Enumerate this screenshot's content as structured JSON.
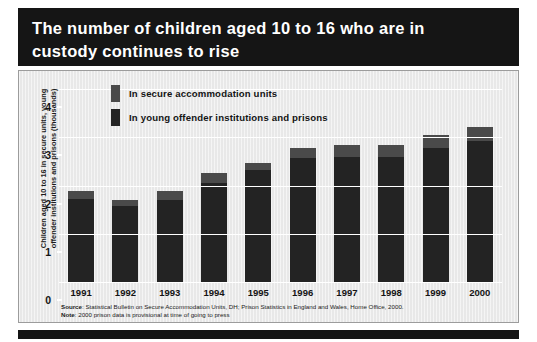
{
  "title": "The number of children aged 10 to 16 who are in\ncustody continues to rise",
  "legend": {
    "items": [
      {
        "label": "In secure accommodation units",
        "color": "#4a4a4a",
        "name": "secure-accommodation-units"
      },
      {
        "label": "In young offender institutions and prisons",
        "color": "#232323",
        "name": "young-offender-institutions-and-prisons"
      }
    ]
  },
  "axis": {
    "ylabel": "Children aged 10 to 16 in secure units, young\noffender institutions and prisons (thousands)",
    "yticks": [
      "0",
      "1",
      "2",
      "3",
      "4"
    ]
  },
  "notes": {
    "source_label": "Source",
    "source_text": ": Statistical Bulletin on Secure Accommodation Units, DH; Prison Statistics in England and Wales, Home Office, 2000.",
    "note_label": "Note",
    "note_text": ": 2000 prison data is provisional at time of going to press"
  },
  "colors": {
    "title_band": "#151515",
    "panel": "#e8e8e8",
    "bar_lower": "#232323",
    "bar_upper": "#4a4a4a",
    "gridline": "#ffffff"
  },
  "chart_data": {
    "type": "bar",
    "subtype": "stacked",
    "title": "The number of children aged 10 to 16 who are in custody continues to rise",
    "xlabel": "",
    "ylabel": "Children aged 10 to 16 in secure units, young offender institutions and prisons (thousands)",
    "ylim": [
      0,
      4
    ],
    "yticks": [
      0,
      1,
      2,
      3,
      4
    ],
    "grid": true,
    "legend_position": "top-left-inside",
    "categories": [
      "1991",
      "1992",
      "1993",
      "1994",
      "1995",
      "1996",
      "1997",
      "1998",
      "1999",
      "2000"
    ],
    "series": [
      {
        "name": "In young offender institutions and prisons",
        "color": "#232323",
        "values": [
          1.73,
          1.57,
          1.7,
          2.06,
          2.32,
          2.57,
          2.59,
          2.59,
          2.77,
          2.92
        ]
      },
      {
        "name": "In secure accommodation units",
        "color": "#4a4a4a",
        "values": [
          0.15,
          0.14,
          0.19,
          0.2,
          0.14,
          0.2,
          0.26,
          0.26,
          0.28,
          0.3
        ]
      }
    ],
    "totals": [
      1.88,
      1.71,
      1.89,
      2.26,
      2.46,
      2.77,
      2.85,
      2.85,
      3.05,
      3.22
    ],
    "annotations": [
      "Source: Statistical Bulletin on Secure Accommodation Units, DH; Prison Statistics in England and Wales, Home Office, 2000.",
      "Note: 2000 prison data is provisional at time of going to press"
    ]
  }
}
